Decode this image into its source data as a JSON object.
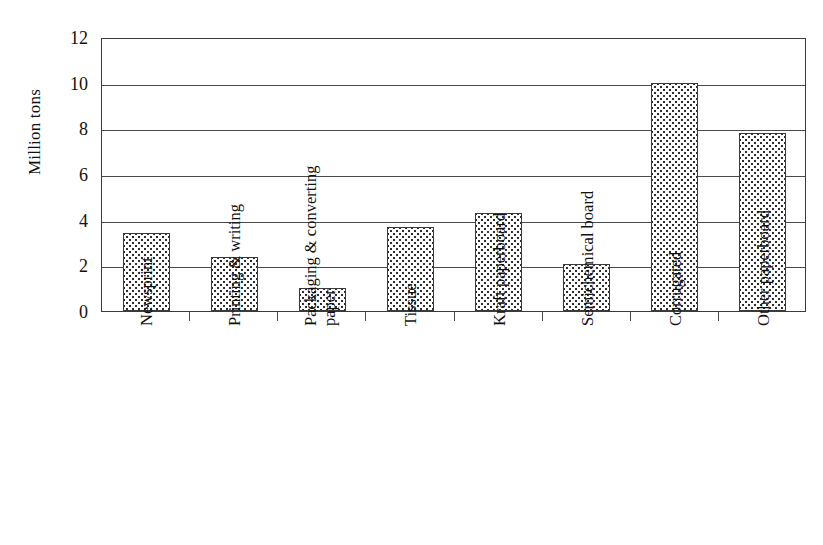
{
  "chart_data": {
    "type": "bar",
    "title": "",
    "subtitle": "",
    "xlabel": "",
    "ylabel": "Million tons",
    "ylim": [
      0,
      12
    ],
    "ytick_step": 2,
    "yticks": [
      12,
      10,
      8,
      6,
      4,
      2,
      0
    ],
    "grid": true,
    "legend": false,
    "legend_position": "none",
    "categories": [
      "Newsprint",
      "Printing & writing",
      "Packaging & converting paper",
      "Tissue",
      "Kraft paperboard",
      "Semichemical board",
      "Corrugated",
      "Other paperboard"
    ],
    "values": [
      3.4,
      2.35,
      1.0,
      3.7,
      4.3,
      2.05,
      10.0,
      7.8
    ],
    "bar_fill": "dotted-stipple",
    "bar_edge_color": "#3a3a3a",
    "annotations": []
  },
  "axis": {
    "y_title": "Million tons",
    "y_tick_labels": [
      "12",
      "10",
      "8",
      "6",
      "4",
      "2",
      "0"
    ],
    "x_tick_labels": [
      "Newsprint",
      "Printing & writing",
      "Packaging & converting paper",
      "Tissue",
      "Kraft paperboard",
      "Semichemical board",
      "Corrugated",
      "Other paperboard"
    ]
  },
  "colors": {
    "background": "#ffffff",
    "axis_line": "#3b3b3b",
    "gridline": "#4a4a4a",
    "bar_fill_dot": "#2f2f2f",
    "bar_background": "#fdfdfd",
    "text": "#111111"
  }
}
